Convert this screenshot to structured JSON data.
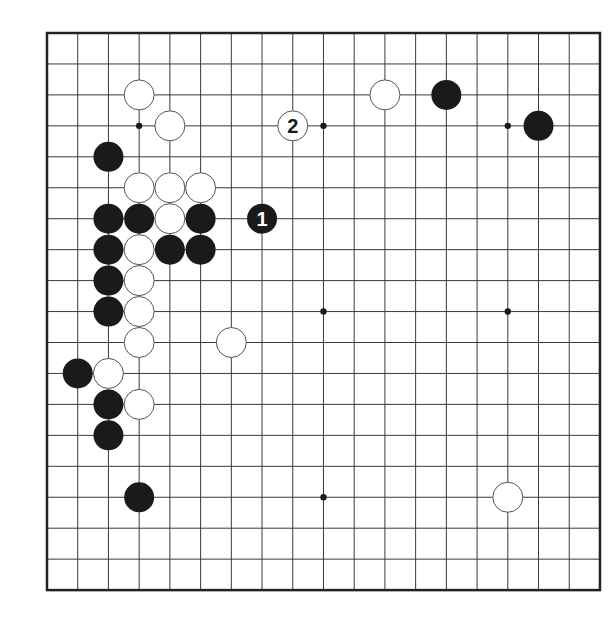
{
  "board": {
    "size": 19,
    "origin_x": 47,
    "origin_y": 33,
    "spacing_x": 30.72,
    "spacing_y": 30.95,
    "stone_radius": 15,
    "colors": {
      "line": "#3a3a3a",
      "border": "#222222",
      "black": "#1a1a1a",
      "white": "#ffffff",
      "background": "#ffffff"
    }
  },
  "star_points": [
    {
      "col": 3,
      "row": 3
    },
    {
      "col": 9,
      "row": 3
    },
    {
      "col": 15,
      "row": 3
    },
    {
      "col": 9,
      "row": 9
    },
    {
      "col": 15,
      "row": 9
    },
    {
      "col": 9,
      "row": 15
    }
  ],
  "stones": [
    {
      "color": "white",
      "col": 3,
      "row": 2
    },
    {
      "color": "white",
      "col": 4,
      "row": 3
    },
    {
      "color": "black",
      "col": 2,
      "row": 4
    },
    {
      "color": "white",
      "col": 3,
      "row": 5
    },
    {
      "color": "white",
      "col": 4,
      "row": 5
    },
    {
      "color": "white",
      "col": 5,
      "row": 5
    },
    {
      "color": "black",
      "col": 2,
      "row": 6
    },
    {
      "color": "black",
      "col": 3,
      "row": 6
    },
    {
      "color": "white",
      "col": 4,
      "row": 6
    },
    {
      "color": "black",
      "col": 5,
      "row": 6
    },
    {
      "color": "black",
      "col": 2,
      "row": 7
    },
    {
      "color": "white",
      "col": 3,
      "row": 7
    },
    {
      "color": "black",
      "col": 4,
      "row": 7
    },
    {
      "color": "black",
      "col": 5,
      "row": 7
    },
    {
      "color": "black",
      "col": 2,
      "row": 8
    },
    {
      "color": "white",
      "col": 3,
      "row": 8
    },
    {
      "color": "black",
      "col": 2,
      "row": 9
    },
    {
      "color": "white",
      "col": 3,
      "row": 9
    },
    {
      "color": "white",
      "col": 3,
      "row": 10
    },
    {
      "color": "white",
      "col": 6,
      "row": 10
    },
    {
      "color": "black",
      "col": 1,
      "row": 11
    },
    {
      "color": "white",
      "col": 2,
      "row": 11
    },
    {
      "color": "black",
      "col": 2,
      "row": 12
    },
    {
      "color": "white",
      "col": 3,
      "row": 12
    },
    {
      "color": "black",
      "col": 2,
      "row": 13
    },
    {
      "color": "black",
      "col": 3,
      "row": 15
    },
    {
      "color": "white",
      "col": 15,
      "row": 15
    },
    {
      "color": "white",
      "col": 11,
      "row": 2
    },
    {
      "color": "black",
      "col": 13,
      "row": 2
    },
    {
      "color": "black",
      "col": 16,
      "row": 3
    }
  ],
  "numbered_moves": [
    {
      "label": "1",
      "color": "black",
      "col": 7,
      "row": 6
    },
    {
      "label": "2",
      "color": "white",
      "col": 8,
      "row": 3
    }
  ]
}
